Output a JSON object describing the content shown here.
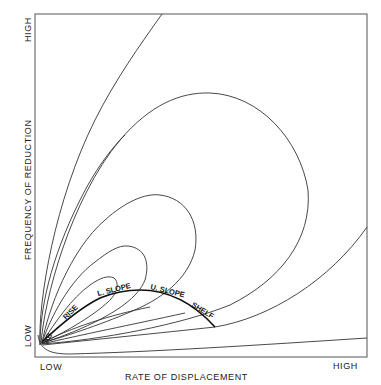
{
  "diagram": {
    "x_axis": {
      "title": "RATE OF DISPLACEMENT",
      "low_label": "LOW",
      "high_label": "HIGH"
    },
    "y_axis": {
      "title": "FREQUENCY OF REDUCTION",
      "low_label": "LOW",
      "high_label": "HIGH"
    },
    "ridge_zones": [
      "AB",
      "RISE",
      "L. SLOPE",
      "U. SLOPE",
      "SHELF"
    ],
    "colors": {
      "line": "#333333",
      "ridge": "#111111",
      "background": "#ffffff"
    }
  }
}
